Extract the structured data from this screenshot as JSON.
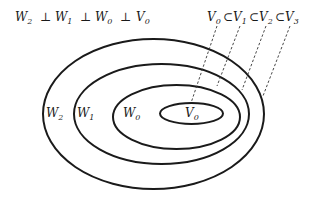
{
  "diagram": {
    "orthogonality_relation": {
      "text": "W₂ ⊥ W₁ ⊥ W₀ ⊥ V₀",
      "terms": [
        {
          "base": "W",
          "sub": "2"
        },
        {
          "base": "W",
          "sub": "1"
        },
        {
          "base": "W",
          "sub": "0"
        },
        {
          "base": "V",
          "sub": "0"
        }
      ],
      "operator": "⊥"
    },
    "nesting_relation": {
      "text": "V₀ ⊂ V₁ ⊂ V₂ ⊂ V₃",
      "terms": [
        {
          "base": "V",
          "sub": "0"
        },
        {
          "base": "V",
          "sub": "1"
        },
        {
          "base": "V",
          "sub": "2"
        },
        {
          "base": "V",
          "sub": "3"
        }
      ],
      "operator": "⊂"
    },
    "regions": [
      {
        "base": "W",
        "sub": "2"
      },
      {
        "base": "W",
        "sub": "1"
      },
      {
        "base": "W",
        "sub": "0"
      },
      {
        "base": "V",
        "sub": "0"
      }
    ],
    "colors": {
      "stroke": "#1a1a1a",
      "background": "#ffffff"
    }
  }
}
